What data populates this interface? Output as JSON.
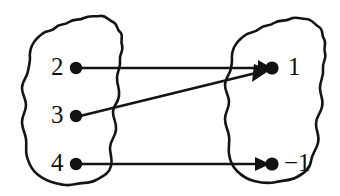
{
  "diagram": {
    "type": "mapping-diagram",
    "style": {
      "stroke_color": "#141414",
      "fill_color": "#ffffff",
      "background": "#ffffff",
      "dot_color": "#121212",
      "stroke_width": 2.6
    },
    "domain_set": {
      "name": "left-set",
      "shape": "irregular-closed-blob",
      "elements": [
        {
          "label": "2",
          "dot_x": 76,
          "dot_y": 68,
          "label_x": 53,
          "label_y": 55
        },
        {
          "label": "3",
          "dot_x": 76,
          "dot_y": 116,
          "label_x": 53,
          "label_y": 103
        },
        {
          "label": "4",
          "dot_x": 76,
          "dot_y": 164,
          "label_x": 53,
          "label_y": 151
        }
      ]
    },
    "codomain_set": {
      "name": "right-set",
      "shape": "irregular-closed-blob",
      "elements": [
        {
          "label": "1",
          "dot_x": 272,
          "dot_y": 68,
          "label_x": 287,
          "label_y": 55
        },
        {
          "label": "−1",
          "dot_x": 272,
          "dot_y": 164,
          "label_x": 285,
          "label_y": 151
        }
      ]
    },
    "arrows": [
      {
        "from": "2",
        "to": "1",
        "x1": 80,
        "y1": 68,
        "x2": 268,
        "y2": 68,
        "kind": "horizontal"
      },
      {
        "from": "3",
        "to": "1",
        "x1": 80,
        "y1": 116,
        "x2": 268,
        "y2": 71,
        "kind": "diagonal-up"
      },
      {
        "from": "4",
        "to": "-1",
        "x1": 80,
        "y1": 164,
        "x2": 268,
        "y2": 164,
        "kind": "horizontal"
      }
    ]
  }
}
